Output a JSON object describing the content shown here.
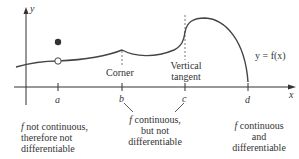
{
  "axes": {
    "x_label": "x",
    "y_label": "y",
    "ticks": [
      "a",
      "b",
      "c",
      "d"
    ]
  },
  "curve": {
    "label": "y = f(x)"
  },
  "annotations": {
    "corner": "Corner",
    "vertical_tangent_line1": "Vertical",
    "vertical_tangent_line2": "tangent"
  },
  "captions": {
    "a": {
      "italic_f": "f",
      "line1_rest": " not continuous,",
      "line2": "therefore not",
      "line3": "differentiable"
    },
    "bc": {
      "italic_f": "f",
      "line1_rest": " continuous,",
      "line2": "but not",
      "line3": "differentiable"
    },
    "d": {
      "italic_f": "f",
      "line1_rest": " continuous",
      "line2": "and",
      "line3": "differentiable"
    }
  },
  "colors": {
    "curve": "#444444",
    "axis": "#333333",
    "text": "#333333"
  }
}
